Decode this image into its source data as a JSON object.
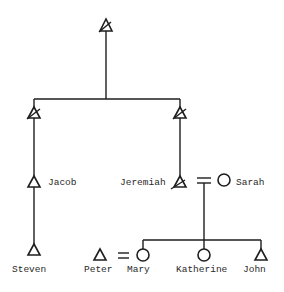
{
  "diagram": {
    "type": "kinship-chart",
    "ink_color": "#1e1e1e",
    "background": "#ffffff",
    "people": [
      {
        "id": "ancestor",
        "name": "",
        "sex": "male",
        "deceased": true
      },
      {
        "id": "son-left",
        "name": "",
        "sex": "male",
        "deceased": true
      },
      {
        "id": "son-right",
        "name": "",
        "sex": "male",
        "deceased": true
      },
      {
        "id": "jacob",
        "name": "Jacob",
        "sex": "male",
        "deceased": false
      },
      {
        "id": "jeremiah",
        "name": "Jeremiah",
        "sex": "male",
        "deceased": true
      },
      {
        "id": "sarah",
        "name": "Sarah",
        "sex": "female",
        "deceased": false
      },
      {
        "id": "steven",
        "name": "Steven",
        "sex": "male",
        "deceased": false
      },
      {
        "id": "peter",
        "name": "Peter",
        "sex": "male",
        "deceased": false
      },
      {
        "id": "mary",
        "name": "Mary",
        "sex": "female",
        "deceased": false
      },
      {
        "id": "katherine",
        "name": "Katherine",
        "sex": "female",
        "deceased": false
      },
      {
        "id": "john",
        "name": "John",
        "sex": "male",
        "deceased": false
      }
    ],
    "labels": {
      "jacob": "Jacob",
      "jeremiah": "Jeremiah",
      "sarah": "Sarah",
      "steven": "Steven",
      "peter": "Peter",
      "mary": "Mary",
      "katherine": "Katherine",
      "john": "John"
    },
    "marriages": [
      {
        "a": "jeremiah",
        "b": "sarah",
        "symbol": "="
      },
      {
        "a": "peter",
        "b": "mary",
        "symbol": "="
      }
    ],
    "descent": [
      {
        "parent": "ancestor",
        "children": [
          "son-left",
          "son-right"
        ]
      },
      {
        "parent": "son-left",
        "children": [
          "jacob"
        ]
      },
      {
        "parent": "son-right",
        "children": [
          "jeremiah"
        ]
      },
      {
        "parent": "jacob",
        "children": [
          "steven"
        ]
      },
      {
        "parents": [
          "jeremiah",
          "sarah"
        ],
        "children": [
          "mary",
          "katherine",
          "john"
        ]
      }
    ],
    "legend": {
      "triangle": "male",
      "circle": "female",
      "slash": "deceased",
      "equals": "marriage"
    }
  }
}
